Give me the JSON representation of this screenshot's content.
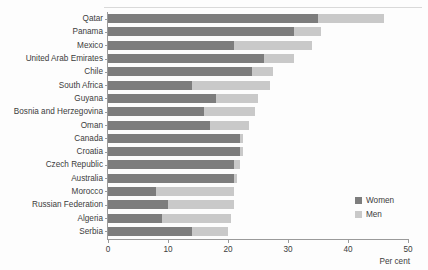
{
  "chart_data": {
    "type": "bar",
    "orientation": "horizontal",
    "stacked": false,
    "title": "",
    "subtitle": "",
    "xlabel": "Per cent",
    "ylabel": "",
    "xlim": [
      0,
      50
    ],
    "xticks": [
      0,
      10,
      20,
      30,
      40,
      50
    ],
    "grid": false,
    "legend_position": "right-inside",
    "categories": [
      "Qatar",
      "Panama",
      "Mexico",
      "United Arab Emirates",
      "Chile",
      "South Africa",
      "Guyana",
      "Bosnia and Herzegovina",
      "Oman",
      "Canada",
      "Croatia",
      "Czech Republic",
      "Australia",
      "Morocco",
      "Russian Federation",
      "Algeria",
      "Serbia"
    ],
    "series": [
      {
        "name": "Women",
        "color": "#7d7d7d",
        "values": [
          35,
          31,
          21,
          26,
          24,
          14,
          18,
          16,
          17,
          22,
          22,
          21,
          21,
          8,
          10,
          9,
          14
        ]
      },
      {
        "name": "Men",
        "color": "#c9c9c9",
        "values": [
          46,
          35.5,
          34,
          31,
          27.5,
          27,
          25,
          24.5,
          23.5,
          22.5,
          22.5,
          22,
          21.5,
          21,
          21,
          20.5,
          20
        ]
      }
    ]
  },
  "legend": {
    "items": [
      {
        "label": "Women",
        "swatch_name": "legend-swatch-women"
      },
      {
        "label": "Men",
        "swatch_name": "legend-swatch-men"
      }
    ]
  },
  "axis": {
    "x_title": "Per cent"
  },
  "colors": {
    "women": "#7d7d7d",
    "men": "#c9c9c9",
    "axis": "#9a9a9a",
    "text": "#3c3c3c",
    "background": "#fdfdfd"
  }
}
